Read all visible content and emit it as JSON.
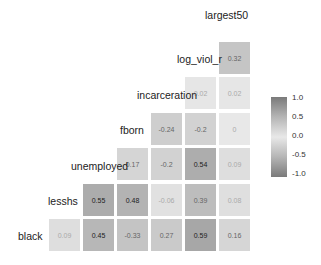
{
  "chart_data": {
    "type": "heatmap",
    "title": "",
    "variables": [
      "black",
      "lesshs",
      "unemployed",
      "fborn",
      "incarceration",
      "log_viol_r",
      "largest50"
    ],
    "matrix_lower": [
      {
        "row": "lesshs",
        "values": {
          "black": 0.09
        }
      },
      {
        "row": "unemployed",
        "values": {
          "black": 0.45,
          "lesshs": 0.55
        }
      },
      {
        "row": "fborn",
        "values": {
          "black": -0.33,
          "lesshs": 0.48,
          "unemployed": 0.17
        }
      },
      {
        "row": "incarceration",
        "values": {
          "black": 0.27,
          "lesshs": -0.06,
          "unemployed": -0.2,
          "fborn": -0.24
        }
      },
      {
        "row": "log_viol_r",
        "values": {
          "black": 0.59,
          "lesshs": 0.39,
          "unemployed": 0.54,
          "fborn": -0.2,
          "incarceration": 0.02
        }
      },
      {
        "row": "largest50",
        "values": {
          "black": 0.16,
          "lesshs": 0.08,
          "unemployed": 0.09,
          "fborn": 0,
          "incarceration": 0.02,
          "log_viol_r": 0.32
        }
      }
    ],
    "legend": {
      "ticks": [
        "1.0",
        "0.5",
        "0.0",
        "-0.5",
        "-1.0"
      ],
      "range": [
        -1,
        1
      ],
      "position": "right"
    },
    "color_scale": {
      "low": "#7a7a7a",
      "mid": "#e8e8e8",
      "high": "#7a7a7a"
    }
  },
  "labels": {
    "black": "black",
    "lesshs": "lesshs",
    "unemployed": "unemployed",
    "fborn": "fborn",
    "incarceration": "incarceration",
    "log_viol_r": "log_viol_r",
    "largest50": "largest50"
  },
  "cells": [
    {
      "id": "black-lesshs",
      "col": 0,
      "row": 5,
      "value": 0.09,
      "text": "0.09"
    },
    {
      "id": "black-unemployed",
      "col": 1,
      "row": 5,
      "value": 0.45,
      "text": "0.45"
    },
    {
      "id": "black-fborn",
      "col": 2,
      "row": 5,
      "value": -0.33,
      "text": "-0.33"
    },
    {
      "id": "black-incarceration",
      "col": 3,
      "row": 5,
      "value": 0.27,
      "text": "0.27"
    },
    {
      "id": "black-log_viol_r",
      "col": 4,
      "row": 5,
      "value": 0.59,
      "text": "0.59"
    },
    {
      "id": "black-largest50",
      "col": 5,
      "row": 5,
      "value": 0.16,
      "text": "0.16"
    },
    {
      "id": "lesshs-unemployed",
      "col": 1,
      "row": 4,
      "value": 0.55,
      "text": "0.55"
    },
    {
      "id": "lesshs-fborn",
      "col": 2,
      "row": 4,
      "value": 0.48,
      "text": "0.48"
    },
    {
      "id": "lesshs-incarceration",
      "col": 3,
      "row": 4,
      "value": -0.06,
      "text": "-0.06"
    },
    {
      "id": "lesshs-log_viol_r",
      "col": 4,
      "row": 4,
      "value": 0.39,
      "text": "0.39"
    },
    {
      "id": "lesshs-largest50",
      "col": 5,
      "row": 4,
      "value": 0.08,
      "text": "0.08"
    },
    {
      "id": "unemployed-fborn",
      "col": 2,
      "row": 3,
      "value": 0.17,
      "text": "0.17"
    },
    {
      "id": "unemployed-incarceration",
      "col": 3,
      "row": 3,
      "value": -0.2,
      "text": "-0.2"
    },
    {
      "id": "unemployed-log_viol_r",
      "col": 4,
      "row": 3,
      "value": 0.54,
      "text": "0.54"
    },
    {
      "id": "unemployed-largest50",
      "col": 5,
      "row": 3,
      "value": 0.09,
      "text": "0.09"
    },
    {
      "id": "fborn-incarceration",
      "col": 3,
      "row": 2,
      "value": -0.24,
      "text": "-0.24"
    },
    {
      "id": "fborn-log_viol_r",
      "col": 4,
      "row": 2,
      "value": -0.2,
      "text": "-0.2"
    },
    {
      "id": "fborn-largest50",
      "col": 5,
      "row": 2,
      "value": 0,
      "text": "0"
    },
    {
      "id": "incarceration-log_viol_r",
      "col": 4,
      "row": 1,
      "value": 0.02,
      "text": "0.02"
    },
    {
      "id": "incarceration-largest50",
      "col": 5,
      "row": 1,
      "value": 0.02,
      "text": "0.02"
    },
    {
      "id": "log_viol_r-largest50",
      "col": 5,
      "row": 0,
      "value": 0.32,
      "text": "0.32"
    }
  ]
}
